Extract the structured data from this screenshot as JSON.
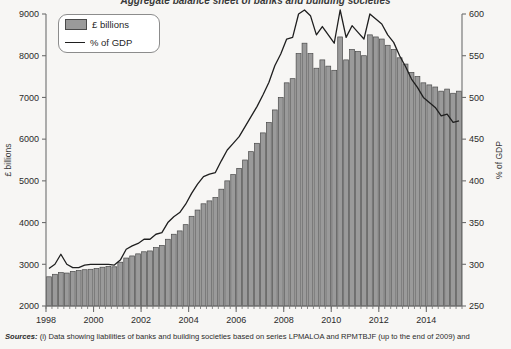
{
  "chart": {
    "title": "Aggregate balance sheet of banks and building societies",
    "sources_lead": "Sources:",
    "sources_text": "(i) Data showing liabilities of banks and building societies based on series LPMALOA and RPMTBJF (up to the end of 2009) and",
    "legend": {
      "bars_label": "£ billions",
      "line_label": "% of GDP",
      "bar_swatch_name": "bar-swatch",
      "line_swatch_name": "line-swatch"
    },
    "colors": {
      "background": "#f7f6f4",
      "bar_fill": "#9a9a9a",
      "bar_stroke": "#4a4a4a",
      "line": "#1f1f1f",
      "axis": "#6e6e6e",
      "text": "#2b2b2b"
    }
  },
  "chart_data": {
    "type": "bar",
    "title": "Aggregate balance sheet of banks and building societies",
    "xlabel": "",
    "ylabel": "£ billions",
    "y2label": "% of GDP",
    "ylim": [
      2000,
      9000
    ],
    "y2lim": [
      250,
      600
    ],
    "yticks": [
      2000,
      3000,
      4000,
      5000,
      6000,
      7000,
      8000,
      9000
    ],
    "y2ticks": [
      250,
      300,
      350,
      400,
      450,
      500,
      550,
      600
    ],
    "xlim": [
      1998.0,
      2015.5
    ],
    "xticks": [
      1998,
      2000,
      2002,
      2004,
      2006,
      2008,
      2010,
      2012,
      2014
    ],
    "xtick_labels": [
      "1998",
      "2000",
      "2002",
      "2004",
      "2006",
      "2008",
      "2010",
      "2012",
      "2014"
    ],
    "minor_tick_interval_years": 0.25,
    "grid": false,
    "legend_position": "top-left",
    "x": [
      1998.0,
      1998.25,
      1998.5,
      1998.75,
      1999.0,
      1999.25,
      1999.5,
      1999.75,
      2000.0,
      2000.25,
      2000.5,
      2000.75,
      2001.0,
      2001.25,
      2001.5,
      2001.75,
      2002.0,
      2002.25,
      2002.5,
      2002.75,
      2003.0,
      2003.25,
      2003.5,
      2003.75,
      2004.0,
      2004.25,
      2004.5,
      2004.75,
      2005.0,
      2005.25,
      2005.5,
      2005.75,
      2006.0,
      2006.25,
      2006.5,
      2006.75,
      2007.0,
      2007.25,
      2007.5,
      2007.75,
      2008.0,
      2008.25,
      2008.5,
      2008.75,
      2009.0,
      2009.25,
      2009.5,
      2009.75,
      2010.0,
      2010.25,
      2010.5,
      2010.75,
      2011.0,
      2011.25,
      2011.5,
      2011.75,
      2012.0,
      2012.25,
      2012.5,
      2012.75,
      2013.0,
      2013.25,
      2013.5,
      2013.75,
      2014.0,
      2014.25,
      2014.5,
      2014.75,
      2015.0,
      2015.25
    ],
    "series": [
      {
        "name": "£ billions",
        "type": "bar",
        "axis": "left",
        "values": [
          2700,
          2760,
          2800,
          2790,
          2830,
          2850,
          2870,
          2880,
          2900,
          2930,
          2950,
          2940,
          3050,
          3150,
          3200,
          3250,
          3300,
          3320,
          3400,
          3450,
          3600,
          3720,
          3800,
          3950,
          4150,
          4300,
          4450,
          4520,
          4600,
          4800,
          5000,
          5150,
          5300,
          5500,
          5700,
          5900,
          6150,
          6400,
          6700,
          7000,
          7350,
          7450,
          8050,
          8300,
          8050,
          7700,
          7900,
          7750,
          7650,
          8450,
          7900,
          8150,
          8100,
          8000,
          8500,
          8450,
          8400,
          8250,
          8150,
          7950,
          7800,
          7600,
          7500,
          7350,
          7300,
          7250,
          7150,
          7200,
          7100,
          7150
        ]
      },
      {
        "name": "% of GDP",
        "type": "line",
        "axis": "right",
        "values": [
          295,
          300,
          312,
          300,
          296,
          296,
          299,
          300,
          300,
          300,
          300,
          299,
          305,
          318,
          322,
          325,
          330,
          330,
          336,
          338,
          350,
          357,
          362,
          372,
          385,
          396,
          405,
          408,
          410,
          424,
          437,
          445,
          453,
          465,
          477,
          489,
          503,
          518,
          538,
          552,
          570,
          572,
          600,
          608,
          598,
          575,
          585,
          575,
          565,
          610,
          572,
          586,
          578,
          570,
          600,
          594,
          588,
          575,
          566,
          550,
          537,
          522,
          512,
          500,
          494,
          488,
          478,
          480,
          470,
          472
        ],
        "note": "Right axis values above 600 are clipped at the plot top"
      }
    ]
  }
}
